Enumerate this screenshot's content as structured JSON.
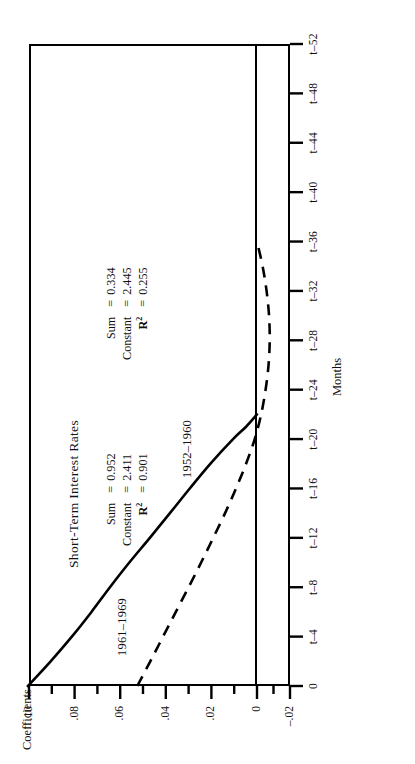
{
  "chart_data": {
    "type": "line",
    "title": "Short-Term Interest Rates",
    "xlabel": "Months",
    "ylabel": "Coefficients",
    "grid": false,
    "legend_position": "inline-annotation",
    "xlim": [
      0,
      52
    ],
    "ylim": [
      -0.02,
      0.1
    ],
    "xtick_labels": [
      "0",
      "t–4",
      "t–8",
      "t–12",
      "t–16",
      "t–20",
      "t–24",
      "t–28",
      "t–32",
      "t–36",
      "t–40",
      "t–44",
      "t–48",
      "t–52"
    ],
    "xtick_values": [
      0,
      4,
      8,
      12,
      16,
      20,
      24,
      28,
      32,
      36,
      40,
      44,
      48,
      52
    ],
    "xtick_minor_values": [
      2,
      6,
      10,
      14,
      18,
      22,
      26,
      30,
      34,
      38,
      42,
      46,
      50
    ],
    "ytick_labels": [
      ".10",
      ".08",
      ".06",
      ".04",
      ".02",
      "0",
      "–.02"
    ],
    "ytick_values": [
      0.1,
      0.08,
      0.06,
      0.04,
      0.02,
      0,
      -0.02
    ],
    "ytick_minor_values": [
      0.09,
      0.07,
      0.05,
      0.03,
      0.01,
      -0.01
    ],
    "series": [
      {
        "name": "1961–1969",
        "style": "solid",
        "x": [
          0,
          2,
          4,
          6,
          8,
          10,
          12,
          14,
          16,
          18,
          20,
          21,
          22
        ],
        "values": [
          0.1005,
          0.0905,
          0.0812,
          0.0726,
          0.0645,
          0.056,
          0.047,
          0.0382,
          0.0295,
          0.0205,
          0.0105,
          0.0048,
          0.0
        ]
      },
      {
        "name": "1952–1960",
        "style": "dashed",
        "x": [
          0,
          2,
          4,
          6,
          8,
          10,
          12,
          14,
          16,
          18,
          20,
          22,
          24,
          26,
          28,
          30,
          32,
          34,
          36
        ],
        "values": [
          0.0525,
          0.0468,
          0.0412,
          0.0356,
          0.03,
          0.0245,
          0.0192,
          0.014,
          0.0092,
          0.0048,
          0.001,
          -0.0025,
          -0.0052,
          -0.007,
          -0.0077,
          -0.0073,
          -0.0058,
          -0.0034,
          0.0
        ]
      }
    ],
    "annotations": [
      {
        "series": "1961–1969",
        "rows": [
          {
            "key": "Sum",
            "eq": "=",
            "value": "0.952"
          },
          {
            "key": "Constant",
            "eq": "=",
            "value": "2.411"
          },
          {
            "key": "R²",
            "eq": "=",
            "value": "0.901"
          }
        ]
      },
      {
        "series": "1952–1960",
        "rows": [
          {
            "key": "Sum",
            "eq": "=",
            "value": "0.334"
          },
          {
            "key": "Constant",
            "eq": "=",
            "value": "2.445"
          },
          {
            "key": "R²",
            "eq": "=",
            "value": "0.255"
          }
        ]
      }
    ]
  },
  "labels": {
    "title": "Short-Term Interest Rates",
    "axis_x": "Months",
    "axis_y": "Coefficients",
    "series_one": "1961–1969",
    "series_two": "1952–1960",
    "stats_one": {
      "sum_key": "Sum",
      "sum_eq": "=",
      "sum_val": "0.952",
      "const_key": "Constant",
      "const_eq": "=",
      "const_val": "2.411",
      "rsq_key": "R",
      "rsq_sup": "2",
      "rsq_eq": "=",
      "rsq_val": "0.901"
    },
    "stats_two": {
      "sum_key": "Sum",
      "sum_eq": "=",
      "sum_val": "0.334",
      "const_key": "Constant",
      "const_eq": "=",
      "const_val": "2.445",
      "rsq_key": "R",
      "rsq_sup": "2",
      "rsq_eq": "=",
      "rsq_val": "0.255"
    }
  },
  "style": {
    "ink": "#000000",
    "paper": "#ffffff"
  }
}
